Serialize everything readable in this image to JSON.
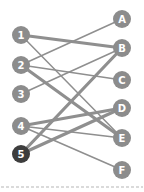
{
  "diagram": {
    "type": "bipartite-graph",
    "colors": {
      "node": "#8c8c8c",
      "node_highlight": "#3d3d3d",
      "edge": "#8f8f8f",
      "label": "#ffffff",
      "divider": "#b5b5b5"
    },
    "left_nodes": [
      {
        "id": "1",
        "label": "1",
        "x": 21,
        "y": 35,
        "highlight": false
      },
      {
        "id": "2",
        "label": "2",
        "x": 21,
        "y": 65,
        "highlight": false
      },
      {
        "id": "3",
        "label": "3",
        "x": 21,
        "y": 94,
        "highlight": false
      },
      {
        "id": "4",
        "label": "4",
        "x": 21,
        "y": 126,
        "highlight": false
      },
      {
        "id": "5",
        "label": "5",
        "x": 21,
        "y": 154,
        "highlight": true
      }
    ],
    "right_nodes": [
      {
        "id": "A",
        "label": "A",
        "x": 122,
        "y": 19,
        "highlight": false
      },
      {
        "id": "B",
        "label": "B",
        "x": 122,
        "y": 48,
        "highlight": false
      },
      {
        "id": "C",
        "label": "C",
        "x": 122,
        "y": 80,
        "highlight": false
      },
      {
        "id": "D",
        "label": "D",
        "x": 122,
        "y": 108,
        "highlight": false
      },
      {
        "id": "E",
        "label": "E",
        "x": 122,
        "y": 138,
        "highlight": false
      },
      {
        "id": "F",
        "label": "F",
        "x": 122,
        "y": 170,
        "highlight": false
      }
    ],
    "edges": [
      {
        "from": "1",
        "to": "B",
        "weight": "thick"
      },
      {
        "from": "1",
        "to": "E",
        "weight": "thin"
      },
      {
        "from": "2",
        "to": "A",
        "weight": "thin"
      },
      {
        "from": "2",
        "to": "C",
        "weight": "thin"
      },
      {
        "from": "2",
        "to": "E",
        "weight": "thick"
      },
      {
        "from": "3",
        "to": "B",
        "weight": "thin"
      },
      {
        "from": "4",
        "to": "D",
        "weight": "thick"
      },
      {
        "from": "4",
        "to": "E",
        "weight": "thin"
      },
      {
        "from": "4",
        "to": "F",
        "weight": "thin"
      },
      {
        "from": "5",
        "to": "B",
        "weight": "thick"
      },
      {
        "from": "5",
        "to": "D",
        "weight": "thick"
      }
    ],
    "node_radius": 9,
    "divider": {
      "y": 187,
      "style": "dashed"
    }
  }
}
